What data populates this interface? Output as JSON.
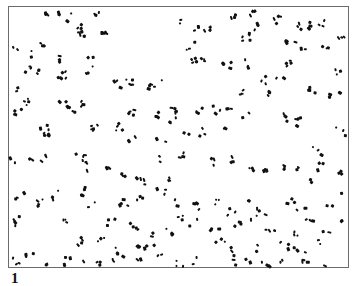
{
  "figure": {
    "panel_label": "1",
    "frame": {
      "x": 8,
      "y": 6,
      "width": 341,
      "height": 262,
      "border_color": "#6b6b6b"
    },
    "particle_color": "#111111",
    "particles": {
      "description": "scattered particle clusters distributed across panel",
      "clusters": [
        [
          45,
          14,
          3
        ],
        [
          62,
          13,
          2
        ],
        [
          68,
          15,
          2
        ],
        [
          95,
          9,
          3
        ],
        [
          42,
          45,
          3
        ],
        [
          80,
          27,
          5
        ],
        [
          83,
          33,
          4
        ],
        [
          105,
          29,
          4
        ],
        [
          16,
          44,
          2
        ],
        [
          32,
          51,
          2
        ],
        [
          35,
          70,
          4
        ],
        [
          27,
          68,
          3
        ],
        [
          60,
          58,
          3
        ],
        [
          62,
          72,
          5
        ],
        [
          90,
          53,
          2
        ],
        [
          90,
          68,
          3
        ],
        [
          16,
          88,
          2
        ],
        [
          25,
          100,
          4
        ],
        [
          18,
          108,
          3
        ],
        [
          62,
          98,
          2
        ],
        [
          72,
          108,
          4
        ],
        [
          80,
          103,
          3
        ],
        [
          115,
          83,
          3
        ],
        [
          128,
          82,
          5
        ],
        [
          150,
          85,
          3
        ],
        [
          160,
          82,
          2
        ],
        [
          130,
          110,
          4
        ],
        [
          158,
          112,
          3
        ],
        [
          170,
          110,
          2
        ],
        [
          95,
          125,
          5
        ],
        [
          120,
          125,
          4
        ],
        [
          45,
          128,
          4
        ],
        [
          48,
          135,
          3
        ],
        [
          132,
          138,
          2
        ],
        [
          175,
          113,
          3
        ],
        [
          160,
          138,
          2
        ],
        [
          172,
          122,
          2
        ],
        [
          180,
          20,
          2
        ],
        [
          200,
          25,
          3
        ],
        [
          208,
          24,
          3
        ],
        [
          230,
          12,
          3
        ],
        [
          253,
          13,
          3
        ],
        [
          255,
          25,
          3
        ],
        [
          275,
          12,
          2
        ],
        [
          278,
          20,
          2
        ],
        [
          305,
          23,
          4
        ],
        [
          302,
          25,
          2
        ],
        [
          322,
          23,
          3
        ],
        [
          340,
          35,
          3
        ],
        [
          190,
          45,
          3
        ],
        [
          195,
          58,
          5
        ],
        [
          200,
          60,
          5
        ],
        [
          220,
          62,
          2
        ],
        [
          250,
          35,
          3
        ],
        [
          245,
          38,
          2
        ],
        [
          290,
          38,
          4
        ],
        [
          300,
          50,
          2
        ],
        [
          325,
          48,
          3
        ],
        [
          340,
          70,
          3
        ],
        [
          245,
          62,
          3
        ],
        [
          228,
          62,
          3
        ],
        [
          262,
          78,
          3
        ],
        [
          290,
          60,
          4
        ],
        [
          310,
          90,
          4
        ],
        [
          330,
          95,
          3
        ],
        [
          340,
          88,
          2
        ],
        [
          240,
          90,
          3
        ],
        [
          265,
          90,
          3
        ],
        [
          280,
          80,
          2
        ],
        [
          200,
          110,
          3
        ],
        [
          217,
          107,
          3
        ],
        [
          230,
          105,
          3
        ],
        [
          248,
          115,
          2
        ],
        [
          285,
          115,
          3
        ],
        [
          298,
          120,
          4
        ],
        [
          340,
          130,
          3
        ],
        [
          200,
          130,
          3
        ],
        [
          185,
          135,
          2
        ],
        [
          223,
          130,
          2
        ],
        [
          45,
          158,
          3
        ],
        [
          30,
          155,
          2
        ],
        [
          80,
          155,
          4
        ],
        [
          90,
          165,
          3
        ],
        [
          110,
          170,
          3
        ],
        [
          125,
          175,
          3
        ],
        [
          140,
          180,
          4
        ],
        [
          12,
          158,
          2
        ],
        [
          155,
          158,
          2
        ],
        [
          170,
          178,
          3
        ],
        [
          180,
          155,
          3
        ],
        [
          215,
          160,
          3
        ],
        [
          230,
          157,
          3
        ],
        [
          250,
          165,
          3
        ],
        [
          265,
          170,
          3
        ],
        [
          280,
          165,
          3
        ],
        [
          300,
          170,
          2
        ],
        [
          320,
          165,
          3
        ],
        [
          340,
          170,
          3
        ],
        [
          317,
          150,
          3
        ],
        [
          310,
          180,
          2
        ],
        [
          20,
          195,
          3
        ],
        [
          40,
          200,
          4
        ],
        [
          55,
          193,
          3
        ],
        [
          85,
          190,
          5
        ],
        [
          90,
          205,
          2
        ],
        [
          125,
          200,
          4
        ],
        [
          140,
          195,
          3
        ],
        [
          160,
          190,
          3
        ],
        [
          175,
          200,
          2
        ],
        [
          195,
          205,
          3
        ],
        [
          215,
          200,
          3
        ],
        [
          232,
          210,
          3
        ],
        [
          248,
          195,
          2
        ],
        [
          260,
          210,
          3
        ],
        [
          290,
          200,
          3
        ],
        [
          300,
          210,
          2
        ],
        [
          330,
          200,
          2
        ],
        [
          345,
          190,
          2
        ],
        [
          10,
          222,
          2
        ],
        [
          17,
          218,
          3
        ],
        [
          65,
          220,
          3
        ],
        [
          110,
          220,
          3
        ],
        [
          135,
          225,
          4
        ],
        [
          150,
          233,
          2
        ],
        [
          170,
          230,
          3
        ],
        [
          180,
          215,
          3
        ],
        [
          195,
          222,
          2
        ],
        [
          215,
          225,
          3
        ],
        [
          238,
          222,
          3
        ],
        [
          255,
          215,
          2
        ],
        [
          270,
          228,
          4
        ],
        [
          295,
          230,
          3
        ],
        [
          310,
          220,
          3
        ],
        [
          325,
          228,
          2
        ],
        [
          340,
          220,
          2
        ],
        [
          80,
          240,
          4
        ],
        [
          100,
          240,
          3
        ],
        [
          120,
          250,
          4
        ],
        [
          135,
          248,
          3
        ],
        [
          150,
          242,
          3
        ],
        [
          160,
          256,
          2
        ],
        [
          220,
          240,
          3
        ],
        [
          230,
          250,
          3
        ],
        [
          255,
          245,
          2
        ],
        [
          285,
          245,
          3
        ],
        [
          300,
          250,
          3
        ],
        [
          320,
          240,
          2
        ],
        [
          15,
          258,
          3
        ],
        [
          30,
          253,
          3
        ],
        [
          45,
          262,
          3
        ],
        [
          70,
          260,
          3
        ],
        [
          85,
          262,
          2
        ],
        [
          100,
          260,
          3
        ],
        [
          115,
          262,
          2
        ],
        [
          140,
          258,
          2
        ],
        [
          180,
          262,
          3
        ],
        [
          195,
          260,
          2
        ],
        [
          233,
          262,
          2
        ],
        [
          250,
          258,
          2
        ],
        [
          265,
          262,
          3
        ],
        [
          282,
          258,
          2
        ],
        [
          305,
          262,
          3
        ],
        [
          328,
          262,
          2
        ]
      ]
    }
  }
}
